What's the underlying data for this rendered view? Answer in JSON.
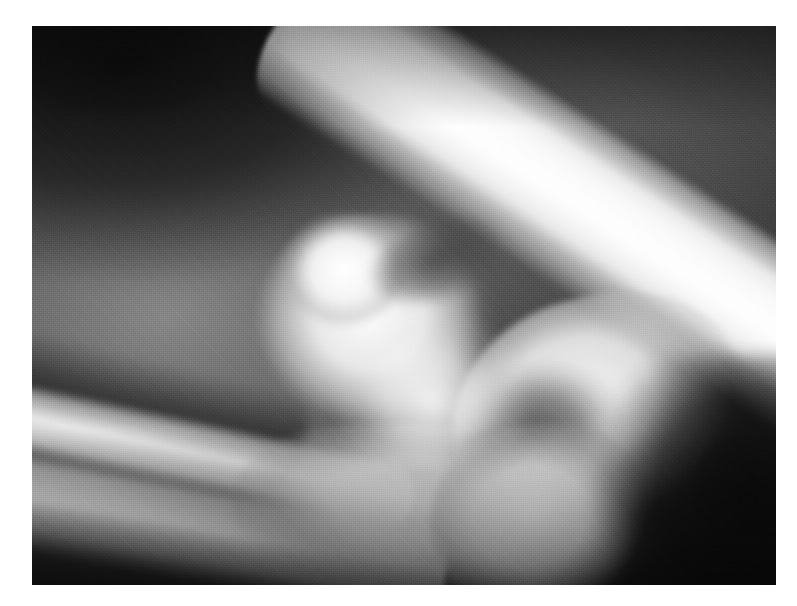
{
  "page": {
    "background_color": "#ffffff",
    "width": 797,
    "height": 606
  },
  "margin_text_fragments": [
    {
      "text": "r"
    },
    {
      "text": "e"
    },
    {
      "text": "l"
    }
  ],
  "figure": {
    "kind": "radiograph",
    "modality": "X-ray",
    "view": "lateral",
    "anatomy": "elbow joint",
    "color_mode": "grayscale",
    "caption": "",
    "plate": {
      "left": 32,
      "top": 26,
      "width": 744,
      "height": 559,
      "border_color": "#ffffff"
    },
    "tone_palette": {
      "darkest_background": "#141414",
      "dark_soft_tissue": "#242424",
      "mid_soft_tissue": "#6a6a6a",
      "light_soft_tissue": "#9a9a9a",
      "cancellous_bone": "#d8d8d8",
      "cortical_bone": "#ebebeb",
      "brightest_bone": "#fafafa"
    },
    "structures": [
      {
        "name": "humerus-shaft",
        "label": "Humeral shaft",
        "position": "upper right, running diagonally toward lower left",
        "brightness": "very bright"
      },
      {
        "name": "distal-humerus",
        "label": "Distal humerus / condylar flare",
        "position": "right of centre",
        "brightness": "bright"
      },
      {
        "name": "capitellum",
        "label": "Capitellum and trochlea",
        "position": "centre",
        "brightness": "bright"
      },
      {
        "name": "medial-epicondyle",
        "label": "Epicondylar knob",
        "position": "upper centre-left of joint",
        "brightness": "bright"
      },
      {
        "name": "radius",
        "label": "Radius",
        "position": "left, upper forearm bone",
        "brightness": "moderately bright"
      },
      {
        "name": "ulna",
        "label": "Ulna",
        "position": "left, lower forearm bone",
        "brightness": "bright"
      },
      {
        "name": "olecranon",
        "label": "Olecranon process",
        "position": "lower right",
        "brightness": "bright"
      },
      {
        "name": "trochlear-notch",
        "label": "Trochlear (semilunar) notch",
        "position": "right of centre, dark crescent",
        "brightness": "dark"
      },
      {
        "name": "joint-space",
        "label": "Elbow joint space",
        "position": "centre",
        "brightness": "brightest overlap"
      }
    ]
  }
}
